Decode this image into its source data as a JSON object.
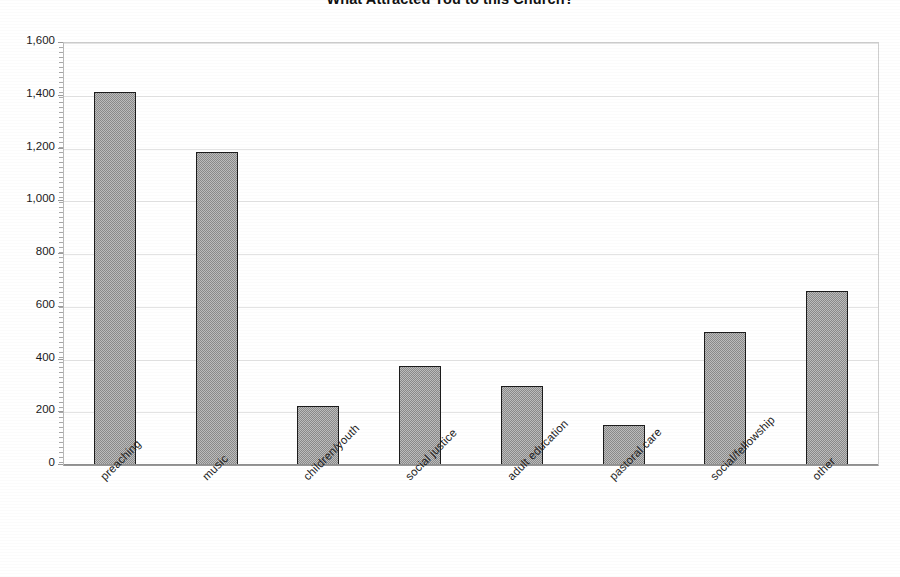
{
  "chart_data": {
    "type": "bar",
    "title": "What Attracted You to this Church?",
    "xlabel": "",
    "ylabel": "",
    "categories": [
      "preaching",
      "music",
      "children/youth",
      "social justice",
      "adult education",
      "pastoral care",
      "social/fellowship",
      "other"
    ],
    "values": [
      1415,
      1185,
      225,
      375,
      300,
      150,
      505,
      660
    ],
    "ylim": [
      0,
      1600
    ],
    "ytick_values": [
      0,
      200,
      400,
      600,
      800,
      1000,
      1200,
      1400,
      1600
    ],
    "ytick_labels": [
      "0",
      "200",
      "400",
      "600",
      "800",
      "1,000",
      "1,200",
      "1,400",
      "1,600"
    ],
    "grid": true,
    "legend": false,
    "legend_position": "none",
    "series": [
      {
        "name": "responses",
        "values": [
          1415,
          1185,
          225,
          375,
          300,
          150,
          505,
          660
        ]
      }
    ],
    "bar_fill_color": "#8a8a8a",
    "bar_border_color": "#1c1c1c",
    "gridline_color": "#e3e3e3",
    "axis_color": "#8f8f8f",
    "plot_background": "#ffffff"
  }
}
